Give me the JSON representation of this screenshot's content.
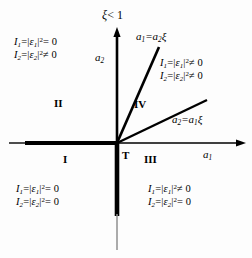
{
  "figure": {
    "title_note": "xi less than one regime diagram",
    "background": "#fdfdfd",
    "stroke": "#000000"
  },
  "axes": {
    "x_label": "a",
    "x_label_sub": "1",
    "y_label": "a",
    "y_label_sub": "2",
    "origin_label": "T"
  },
  "condition_top": {
    "symbol": "ξ",
    "relation": "< 1",
    "text": "ξ < 1"
  },
  "lines": [
    {
      "name": "steep-line",
      "label_lhs": "a",
      "label_lhs_sub": "1",
      "label_eq": "=",
      "label_rhs": "a",
      "label_rhs_sub": "2",
      "label_xi": "ξ",
      "text": "a₁ = a₂ξ"
    },
    {
      "name": "shallow-line",
      "label_lhs": "a",
      "label_lhs_sub": "2",
      "label_eq": "=",
      "label_rhs": "a",
      "label_rhs_sub": "1",
      "label_xi": "ξ",
      "text": "a₂ = a₁ξ"
    }
  ],
  "regions": [
    {
      "name": "region-I",
      "label": "I"
    },
    {
      "name": "region-II",
      "label": "II"
    },
    {
      "name": "region-III",
      "label": "III"
    },
    {
      "name": "region-IV",
      "label": "IV"
    },
    {
      "name": "region-T",
      "label": "T"
    }
  ],
  "conditions": {
    "top_left": {
      "line1": {
        "I": "I",
        "I_sub": "1",
        "eq1": "=",
        "eps": "ε",
        "eps_sub": "1",
        "pow": "2",
        "rel": "= 0"
      },
      "line2": {
        "I": "I",
        "I_sub": "2",
        "eq1": "=",
        "eps": "ε",
        "eps_sub": "2",
        "pow": "2",
        "rel": "≠ 0"
      },
      "text1": "I₁ = |ε₁|² = 0",
      "text2": "I₂ = |ε₂|² ≠ 0"
    },
    "top_right": {
      "line1": {
        "I": "I",
        "I_sub": "1",
        "eq1": "=",
        "eps": "ε",
        "eps_sub": "1",
        "pow": "2",
        "rel": "≠ 0"
      },
      "line2": {
        "I": "I",
        "I_sub": "2",
        "eq1": "=",
        "eps": "ε",
        "eps_sub": "2",
        "pow": "2",
        "rel": "≠ 0"
      },
      "text1": "I₁ = |ε₁|² ≠ 0",
      "text2": "I₂ = |ε₂|² ≠ 0"
    },
    "bottom_left": {
      "line1": {
        "I": "I",
        "I_sub": "1",
        "eq1": "=",
        "eps": "ε",
        "eps_sub": "1",
        "pow": "2",
        "rel": "= 0"
      },
      "line2": {
        "I": "I",
        "I_sub": "2",
        "eq1": "=",
        "eps": "ε",
        "eps_sub": "2",
        "pow": "2",
        "rel": "= 0"
      },
      "text1": "I₁ = |ε₁|² = 0",
      "text2": "I₂ = |ε₂|² = 0"
    },
    "bottom_right": {
      "line1": {
        "I": "I",
        "I_sub": "1",
        "eq1": "=",
        "eps": "ε",
        "eps_sub": "1",
        "pow": "2",
        "rel": "≠ 0"
      },
      "line2": {
        "I": "I",
        "I_sub": "2",
        "eq1": "=",
        "eps": "ε",
        "eps_sub": "2",
        "pow": "2",
        "rel": "= 0"
      },
      "text1": "I₁ = |ε₁|² ≠ 0",
      "text2": "I₂ = |ε₂|² = 0"
    }
  }
}
